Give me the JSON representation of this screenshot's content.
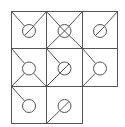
{
  "diagram": {
    "type": "tile-grid",
    "rows": 3,
    "cols": 3,
    "stroke_color": "#555555",
    "background": "#ffffff",
    "tiles": [
      {
        "row": 0,
        "col": 0,
        "lines": [
          "tl-center",
          "tr-center"
        ],
        "symbol": "circle-slash"
      },
      {
        "row": 0,
        "col": 1,
        "lines": [
          "tl-center",
          "tr-center",
          "bl-center",
          "br-center"
        ],
        "symbol": "circle-x"
      },
      {
        "row": 0,
        "col": 2,
        "lines": [
          "tr-center"
        ],
        "symbol": "circle-slash"
      },
      {
        "row": 1,
        "col": 0,
        "lines": [
          "tl-center",
          "bl-center",
          "br-center"
        ],
        "symbol": "circle"
      },
      {
        "row": 1,
        "col": 1,
        "lines": [
          "tl-center",
          "bl-center"
        ],
        "symbol": "circle-slash"
      },
      {
        "row": 1,
        "col": 2,
        "lines": [
          "tl-center",
          "bl-center"
        ],
        "symbol": "circle"
      },
      {
        "row": 2,
        "col": 0,
        "lines": [
          "tl-center"
        ],
        "symbol": "circle"
      },
      {
        "row": 2,
        "col": 1,
        "lines": [
          "bl-center"
        ],
        "symbol": "circle-slash"
      }
    ]
  }
}
